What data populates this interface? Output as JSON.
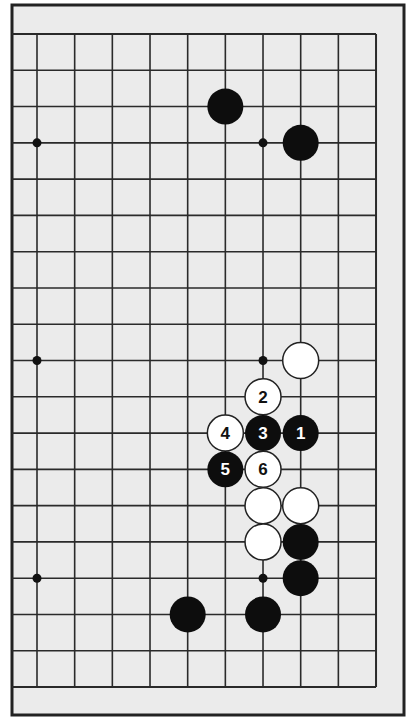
{
  "diagram": {
    "type": "go-board-partial",
    "frame": {
      "x": 12,
      "y": 5,
      "width": 392,
      "height": 710
    },
    "background": "#ebebeb",
    "line_color": "#2a2a2a",
    "grid": {
      "x0": 37,
      "y0": 34,
      "dx": 37.67,
      "dy": 36.28,
      "cols": 10,
      "rows": 19,
      "left_extend_to": 12,
      "note": "right, top and bottom edges of board visible; left side cut off"
    },
    "star_points": [
      {
        "col": 0,
        "row": 3
      },
      {
        "col": 6,
        "row": 3
      },
      {
        "col": 0,
        "row": 9
      },
      {
        "col": 6,
        "row": 9
      },
      {
        "col": 0,
        "row": 15
      },
      {
        "col": 6,
        "row": 15
      }
    ],
    "stones": [
      {
        "color": "black",
        "col": 5,
        "row": 2,
        "label": ""
      },
      {
        "color": "black",
        "col": 7,
        "row": 3,
        "label": ""
      },
      {
        "color": "white",
        "col": 7,
        "row": 9,
        "label": ""
      },
      {
        "color": "white",
        "col": 6,
        "row": 10,
        "label": "2"
      },
      {
        "color": "black",
        "col": 7,
        "row": 11,
        "label": "1"
      },
      {
        "color": "black",
        "col": 6,
        "row": 11,
        "label": "3"
      },
      {
        "color": "white",
        "col": 5,
        "row": 11,
        "label": "4"
      },
      {
        "color": "black",
        "col": 5,
        "row": 12,
        "label": "5"
      },
      {
        "color": "white",
        "col": 6,
        "row": 12,
        "label": "6"
      },
      {
        "color": "white",
        "col": 6,
        "row": 13,
        "label": ""
      },
      {
        "color": "white",
        "col": 7,
        "row": 13,
        "label": ""
      },
      {
        "color": "white",
        "col": 6,
        "row": 14,
        "label": ""
      },
      {
        "color": "black",
        "col": 7,
        "row": 14,
        "label": ""
      },
      {
        "color": "black",
        "col": 7,
        "row": 15,
        "label": ""
      },
      {
        "color": "black",
        "col": 4,
        "row": 16,
        "label": ""
      },
      {
        "color": "black",
        "col": 6,
        "row": 16,
        "label": ""
      }
    ]
  }
}
